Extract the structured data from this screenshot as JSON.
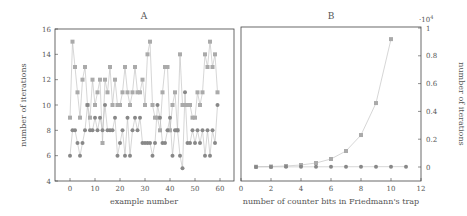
{
  "chart_data": [
    {
      "type": "line",
      "title": "A",
      "xlabel": "example number",
      "ylabel": "number of iterations",
      "xlim": [
        -6,
        65
      ],
      "ylim": [
        4,
        16
      ],
      "xticks": [
        0,
        10,
        20,
        30,
        40,
        50,
        60
      ],
      "yticks": [
        4,
        6,
        8,
        10,
        12,
        14,
        16
      ],
      "grid": false,
      "x": [
        0,
        1,
        2,
        3,
        4,
        5,
        6,
        7,
        8,
        9,
        10,
        11,
        12,
        13,
        14,
        15,
        16,
        17,
        18,
        19,
        20,
        21,
        22,
        23,
        24,
        25,
        26,
        27,
        28,
        29,
        30,
        31,
        32,
        33,
        34,
        35,
        36,
        37,
        38,
        39,
        40,
        41,
        42,
        43,
        44,
        45,
        46,
        47,
        48,
        49,
        50,
        51,
        52,
        53,
        54,
        55,
        56,
        57,
        58,
        59
      ],
      "series": [
        {
          "name": "squares",
          "marker": "square",
          "color": "#aaaaaa",
          "values": [
            9,
            15,
            13,
            11,
            9,
            12,
            13,
            10,
            9,
            12,
            10,
            11,
            12,
            7,
            12,
            11,
            13,
            10,
            12,
            10,
            10,
            11,
            13,
            11,
            10,
            11,
            13,
            11,
            11,
            12,
            10,
            14,
            15,
            10,
            9,
            9,
            8,
            11,
            13,
            13,
            8,
            10,
            11,
            8,
            14,
            10,
            10,
            10,
            10,
            9,
            9,
            11,
            10,
            11,
            14,
            13,
            15,
            13,
            14,
            11
          ]
        },
        {
          "name": "circles",
          "marker": "circle",
          "color": "#888888",
          "values": [
            6,
            8,
            8,
            7,
            6,
            7,
            8,
            10,
            8,
            8,
            9,
            8,
            9,
            8,
            10,
            8,
            8,
            8,
            9,
            6,
            7,
            8,
            6,
            9,
            6,
            8,
            9,
            8,
            9,
            7,
            7,
            7,
            7,
            6,
            7,
            10,
            9,
            7,
            7,
            8,
            9,
            6,
            8,
            8,
            6,
            5,
            11,
            7,
            7,
            8,
            7,
            8,
            7,
            8,
            6,
            8,
            6,
            8,
            7,
            10
          ]
        }
      ]
    },
    {
      "type": "line",
      "title": "B",
      "xlabel": "number of counter bits in Friedmann's trap",
      "ylabel": "number of iterations",
      "y_multiplier": "·10⁴",
      "xlim": [
        0,
        12
      ],
      "ylim": [
        -0.1,
        1
      ],
      "xticks": [
        0,
        2,
        4,
        6,
        8,
        10,
        12
      ],
      "yticks": [
        0,
        0.2,
        0.4,
        0.6,
        0.8,
        1
      ],
      "ytick_labels": [
        "0",
        "0.2",
        "0.4",
        "0.6",
        "0.8",
        "1"
      ],
      "y_axis_position": "right",
      "grid": false,
      "series": [
        {
          "name": "squares",
          "marker": "square",
          "color": "#aaaaaa",
          "x": [
            1,
            2,
            3,
            4,
            5,
            6,
            7,
            8,
            9,
            10
          ],
          "values": [
            0.0018,
            0.0036,
            0.0072,
            0.0144,
            0.0288,
            0.0576,
            0.115,
            0.23,
            0.46,
            0.92
          ]
        },
        {
          "name": "circles",
          "marker": "circle",
          "color": "#888888",
          "x": [
            1,
            2,
            3,
            4,
            5,
            6,
            7,
            8,
            9,
            10,
            11
          ],
          "values": [
            0.0006,
            0.0008,
            0.001,
            0.0012,
            0.0014,
            0.0016,
            0.0018,
            0.002,
            0.0022,
            0.0024,
            0.0026
          ]
        }
      ]
    }
  ],
  "panels": {
    "a": {
      "title": "A",
      "xlabel": "example number",
      "ylabel": "number of iterations"
    },
    "b": {
      "title": "B",
      "xlabel": "number of counter bits in Friedmann's trap",
      "ylabel": "number of iterations",
      "multiplier_base": "·10",
      "multiplier_exp": "4"
    }
  }
}
